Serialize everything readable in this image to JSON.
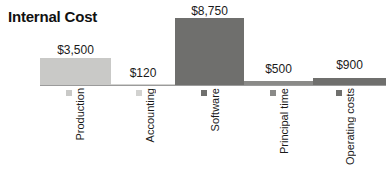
{
  "chart_data": {
    "type": "bar",
    "title": "Internal Cost",
    "xlabel": "",
    "ylabel": "",
    "ylim": [
      0,
      8750
    ],
    "grid": false,
    "legend": "below-axis-rotated",
    "categories": [
      "Production",
      "Accounting",
      "Software",
      "Principal time",
      "Operating costs"
    ],
    "values": [
      3500,
      120,
      8750,
      500,
      900
    ],
    "value_labels": [
      "$3,500",
      "$120",
      "$8,750",
      "$500",
      "$900"
    ],
    "series": [
      {
        "name": "Internal Cost",
        "values": [
          3500,
          120,
          8750,
          500,
          900
        ]
      }
    ],
    "bar_colors": [
      "#c9c9c7",
      "#d2d2d0",
      "#6f6f6d",
      "#8a8a88",
      "#6f6f6d"
    ],
    "baseline_color": "#9b9b9b",
    "background": "#ffffff"
  },
  "bars": [
    {
      "category": "Production",
      "value_label": "$3,500",
      "color": "#c9c9c7",
      "left": 40,
      "width": 71,
      "height": 27,
      "label_left": 40,
      "label_width": 71,
      "label_top": 43,
      "swatch_left": 66
    },
    {
      "category": "Accounting",
      "value_label": "$120",
      "color": "#d2d2d0",
      "left": 111,
      "width": 64,
      "height": 1,
      "label_left": 111,
      "label_width": 64,
      "label_top": 66,
      "swatch_left": 136
    },
    {
      "category": "Software",
      "value_label": "$8,750",
      "color": "#6f6f6d",
      "left": 175,
      "width": 69,
      "height": 67,
      "label_left": 175,
      "label_width": 69,
      "label_top": 4,
      "swatch_left": 201
    },
    {
      "category": "Principal time",
      "value_label": "$500",
      "color": "#8a8a88",
      "left": 244,
      "width": 69,
      "height": 4,
      "label_left": 244,
      "label_width": 69,
      "label_top": 62,
      "swatch_left": 270
    },
    {
      "category": "Operating costs",
      "value_label": "$900",
      "color": "#6f6f6d",
      "left": 313,
      "width": 73,
      "height": 7,
      "label_left": 313,
      "label_width": 73,
      "label_top": 58,
      "swatch_left": 336
    }
  ]
}
